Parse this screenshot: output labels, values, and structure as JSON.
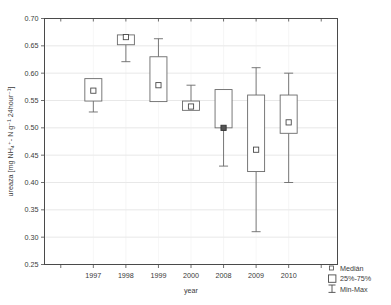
{
  "chart_data": {
    "type": "box",
    "title": "",
    "xlabel": "year",
    "ylabel": "ureaza [mg NH₄⁺- N g⁻¹ 24hour⁻¹]",
    "categories": [
      "1997",
      "1998",
      "1999",
      "2000",
      "2008",
      "2009",
      "2010"
    ],
    "ylim": [
      0.25,
      0.7
    ],
    "ytick_labels": [
      "0.25",
      "0.30",
      "0.35",
      "0.40",
      "0.45",
      "0.50",
      "0.55",
      "0.60",
      "0.65",
      "0.70"
    ],
    "ytick_values": [
      0.25,
      0.3,
      0.35,
      0.4,
      0.45,
      0.5,
      0.55,
      0.6,
      0.65,
      0.7
    ],
    "grid": true,
    "legend_position": "bottom-right",
    "legend": [
      {
        "key": "median",
        "label": "Medián",
        "marker": "small-square"
      },
      {
        "key": "quartiles",
        "label": "25%-75%",
        "marker": "box"
      },
      {
        "key": "range",
        "label": "Min-Max",
        "marker": "whisker"
      }
    ],
    "boxes": [
      {
        "category": "1997",
        "min": 0.529,
        "q1": 0.549,
        "median": 0.568,
        "q3": 0.59,
        "max": 0.59,
        "median_filled": false
      },
      {
        "category": "1998",
        "min": 0.621,
        "q1": 0.652,
        "median": 0.666,
        "q3": 0.67,
        "max": 0.67,
        "median_filled": false
      },
      {
        "category": "1999",
        "min": 0.548,
        "q1": 0.548,
        "median": 0.578,
        "q3": 0.63,
        "max": 0.663,
        "median_filled": false
      },
      {
        "category": "2000",
        "min": 0.532,
        "q1": 0.532,
        "median": 0.539,
        "q3": 0.549,
        "max": 0.578,
        "median_filled": false
      },
      {
        "category": "2008",
        "min": 0.43,
        "q1": 0.5,
        "median": 0.5,
        "q3": 0.57,
        "max": 0.57,
        "median_filled": true
      },
      {
        "category": "2009",
        "min": 0.31,
        "q1": 0.42,
        "median": 0.46,
        "q3": 0.56,
        "max": 0.61,
        "median_filled": false
      },
      {
        "category": "2010",
        "min": 0.4,
        "q1": 0.49,
        "median": 0.51,
        "q3": 0.56,
        "max": 0.6,
        "median_filled": false
      }
    ]
  }
}
